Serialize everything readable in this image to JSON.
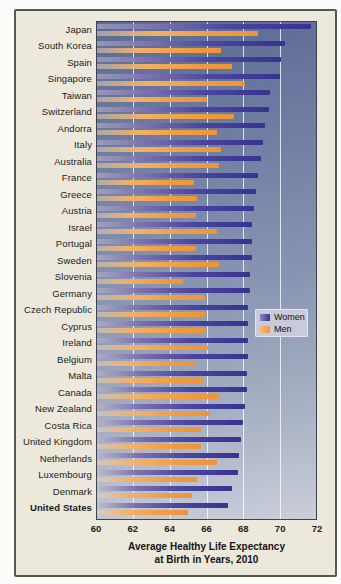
{
  "figure": {
    "caption_line1": "Average Healthy Life Expectancy",
    "caption_line2": "at Birth in Years, 2010"
  },
  "legend": {
    "women_label": "Women",
    "men_label": "Men"
  },
  "colors": {
    "women_bar": "#383391",
    "men_bar": "#ed9437",
    "panel_top": "#5c6b94",
    "panel_bottom": "#c9ced9",
    "figure_background": "#ece8db",
    "gridline": "#ffffff"
  },
  "axis": {
    "min": 60,
    "max": 72,
    "tick_labels": [
      "60",
      "62",
      "64",
      "66",
      "68",
      "70",
      "72"
    ]
  },
  "chart_data": {
    "type": "bar",
    "orientation": "horizontal",
    "title": "Average Healthy Life Expectancy at Birth in Years, 2010",
    "xlabel": "Average Healthy Life Expectancy at Birth in Years, 2010",
    "xlim": [
      60,
      72
    ],
    "xticks": [
      60,
      62,
      64,
      66,
      68,
      70,
      72
    ],
    "grid": true,
    "legend_position": "center-right",
    "highlight_category": "United States",
    "categories": [
      "Japan",
      "South Korea",
      "Spain",
      "Singapore",
      "Taiwan",
      "Switzerland",
      "Andorra",
      "Italy",
      "Australia",
      "France",
      "Greece",
      "Austria",
      "Israel",
      "Portugal",
      "Sweden",
      "Slovenia",
      "Germany",
      "Czech Republic",
      "Cyprus",
      "Ireland",
      "Belgium",
      "Malta",
      "Canada",
      "New Zealand",
      "Costa Rica",
      "United Kingdom",
      "Netherlands",
      "Luxembourg",
      "Denmark",
      "United States"
    ],
    "series": [
      {
        "name": "Women",
        "values": [
          71.7,
          70.3,
          70.1,
          70.0,
          69.5,
          69.4,
          69.2,
          69.1,
          69.0,
          68.8,
          68.7,
          68.6,
          68.5,
          68.5,
          68.5,
          68.4,
          68.4,
          68.3,
          68.3,
          68.3,
          68.3,
          68.2,
          68.2,
          68.1,
          68.0,
          67.9,
          67.8,
          67.7,
          67.4,
          67.2
        ]
      },
      {
        "name": "Men",
        "values": [
          68.8,
          66.8,
          67.4,
          68.1,
          66.0,
          67.5,
          66.6,
          66.8,
          66.7,
          65.3,
          65.5,
          65.4,
          66.6,
          65.4,
          66.7,
          64.7,
          65.9,
          65.9,
          65.9,
          66.1,
          65.4,
          65.8,
          66.7,
          66.2,
          65.7,
          65.7,
          66.6,
          65.5,
          65.2,
          65.0
        ]
      }
    ]
  }
}
